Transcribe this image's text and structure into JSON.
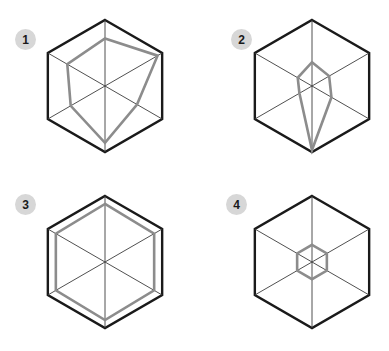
{
  "figure": {
    "type": "radar-chart-grid",
    "background_color": "#ffffff",
    "grid_color": "#1a1a1a",
    "spoke_color": "#3c3c3c",
    "series_color": "#8c8c8c",
    "badge_bg_color": "#d7d7d7",
    "badge_text_color": "#1a1a1a",
    "axes_count": 6,
    "axis_max": 1.0,
    "panel_count": 4,
    "panel_layout": "2x2"
  },
  "panels": [
    {
      "label": "1",
      "badge_name": "panel-badge-1",
      "center": {
        "x": 105,
        "y": 86
      },
      "radius": 66,
      "values": [
        0.72,
        0.92,
        0.56,
        0.86,
        0.6,
        0.66
      ]
    },
    {
      "label": "2",
      "badge_name": "panel-badge-2",
      "center": {
        "x": 312,
        "y": 86
      },
      "radius": 66,
      "values": [
        0.36,
        0.3,
        0.34,
        0.97,
        0.22,
        0.25
      ]
    },
    {
      "label": "3",
      "badge_name": "panel-badge-3",
      "center": {
        "x": 105,
        "y": 262
      },
      "radius": 66,
      "values": [
        0.88,
        0.86,
        0.86,
        0.88,
        0.86,
        0.86
      ]
    },
    {
      "label": "4",
      "badge_name": "panel-badge-4",
      "center": {
        "x": 312,
        "y": 262
      },
      "radius": 66,
      "values": [
        0.26,
        0.26,
        0.26,
        0.26,
        0.26,
        0.26
      ]
    }
  ],
  "chart_data": {
    "type": "radar",
    "title": "",
    "subtitle": "",
    "xlabel": "",
    "ylabel": "",
    "grid": true,
    "legend_position": "none",
    "axis_count": 6,
    "axis_labels": [
      "A1",
      "A2",
      "A3",
      "A4",
      "A5",
      "A6"
    ],
    "axis_angles_deg": [
      90,
      30,
      330,
      270,
      210,
      150
    ],
    "rlim": [
      0,
      1
    ],
    "rticks": [
      1
    ],
    "categories": [
      "axis-top",
      "axis-upper-right",
      "axis-lower-right",
      "axis-bottom",
      "axis-lower-left",
      "axis-upper-left"
    ],
    "series": [
      {
        "name": "1",
        "values": [
          0.72,
          0.92,
          0.56,
          0.86,
          0.6,
          0.66
        ]
      },
      {
        "name": "2",
        "values": [
          0.36,
          0.3,
          0.34,
          0.97,
          0.22,
          0.25
        ]
      },
      {
        "name": "3",
        "values": [
          0.88,
          0.86,
          0.86,
          0.88,
          0.86,
          0.86
        ]
      },
      {
        "name": "4",
        "values": [
          0.26,
          0.26,
          0.26,
          0.26,
          0.26,
          0.26
        ]
      }
    ],
    "annotations": [
      "1",
      "2",
      "3",
      "4"
    ]
  }
}
